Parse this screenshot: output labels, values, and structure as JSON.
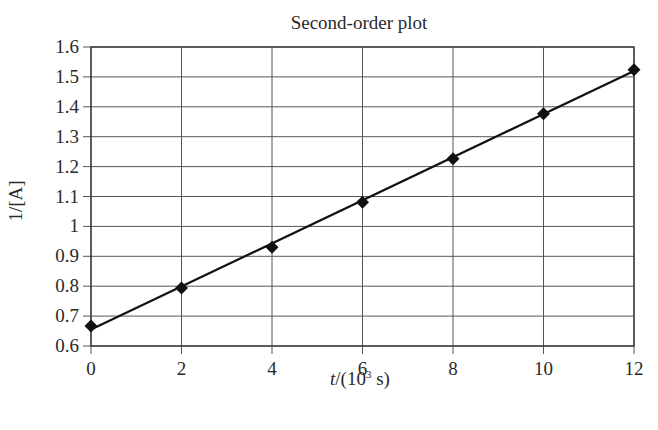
{
  "chart_data": {
    "type": "scatter",
    "title": "Second-order plot",
    "xlabel": "t/(10³ s)",
    "xlabel_parts": {
      "var": "t",
      "prefix": "/(10",
      "sup": "3",
      "suffix": " s)"
    },
    "ylabel": "1/[A]",
    "xlim": [
      0,
      12
    ],
    "ylim": [
      0.6,
      1.6
    ],
    "x_ticks": [
      0,
      2,
      4,
      6,
      8,
      10,
      12
    ],
    "y_ticks": [
      0.6,
      0.7,
      0.8,
      0.9,
      1,
      1.1,
      1.2,
      1.3,
      1.4,
      1.5,
      1.6
    ],
    "y_tick_labels": [
      "0.6",
      "0.7",
      "0.8",
      "0.9",
      "1",
      "1.1",
      "1.2",
      "1.3",
      "1.4",
      "1.5",
      "1.6"
    ],
    "grid": true,
    "legend": null,
    "series": [
      {
        "name": "data",
        "marker": "diamond",
        "color": "#111111",
        "x": [
          0,
          2,
          4,
          6,
          8,
          10,
          12
        ],
        "y": [
          0.667,
          0.794,
          0.93,
          1.081,
          1.226,
          1.377,
          1.524
        ]
      }
    ],
    "trendline": {
      "type": "linear",
      "color": "#111111",
      "x": [
        0,
        12
      ],
      "y": [
        0.655,
        1.52
      ]
    }
  },
  "colors": {
    "axis": "#333333",
    "grid": "#555555",
    "marker": "#111111",
    "line": "#111111",
    "background": "#ffffff"
  }
}
